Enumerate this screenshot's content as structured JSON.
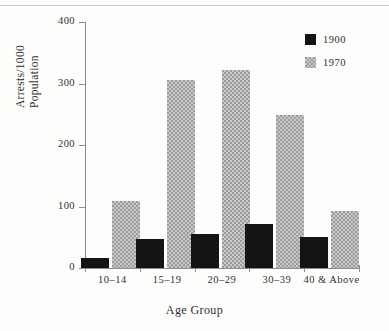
{
  "chart_data": {
    "type": "bar",
    "title": "",
    "xlabel": "Age Group",
    "ylabel": "Arrests/1000 Population",
    "ylabel_lines": [
      "Arrests/1000",
      "Population"
    ],
    "categories": [
      "10–14",
      "15–19",
      "20–29",
      "30–39",
      "40 & Above"
    ],
    "series": [
      {
        "name": "1900",
        "color": "#141414",
        "values": [
          17,
          47,
          56,
          72,
          51
        ]
      },
      {
        "name": "1970",
        "color": "#9b9b9b",
        "values": [
          109,
          306,
          322,
          248,
          92
        ]
      }
    ],
    "ylim": [
      0,
      400
    ],
    "yticks": [
      0,
      100,
      200,
      300,
      400
    ],
    "ytick_labels": [
      "0",
      "100",
      "200",
      "300",
      "400"
    ],
    "grid": false,
    "legend_position": "top-right",
    "legend_entries": [
      "1900",
      "1970"
    ]
  }
}
